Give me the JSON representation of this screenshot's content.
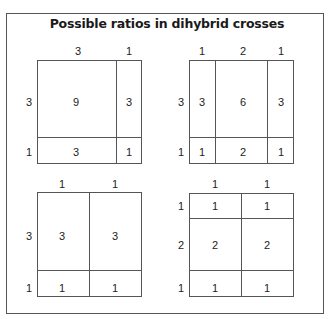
{
  "title": "Possible ratios in dihybrid crosses",
  "diagrams": [
    {
      "name": "9:3:3:1",
      "top_labels": [
        "3",
        "1"
      ],
      "side_labels": [
        "3",
        "1"
      ],
      "cells": [
        [
          "9",
          "3"
        ],
        [
          "3",
          "1"
        ]
      ]
    },
    {
      "name": "3:6:3:1:2:1",
      "top_labels": [
        "1",
        "2",
        "1"
      ],
      "side_labels": [
        "3",
        "1"
      ],
      "cells": [
        [
          "3",
          "6",
          "3"
        ],
        [
          "1",
          "2",
          "1"
        ]
      ]
    },
    {
      "name": "3:3:1:1",
      "top_labels": [
        "1",
        "1"
      ],
      "side_labels": [
        "3",
        "1"
      ],
      "cells": [
        [
          "3",
          "3"
        ],
        [
          "1",
          "1"
        ]
      ]
    },
    {
      "name": "1:1:2:2:1:1",
      "top_labels": [
        "1",
        "1"
      ],
      "side_labels": [
        "1",
        "2",
        "1"
      ],
      "cells": [
        [
          "1",
          "1"
        ],
        [
          "2",
          "2"
        ],
        [
          "1",
          "1"
        ]
      ]
    }
  ]
}
